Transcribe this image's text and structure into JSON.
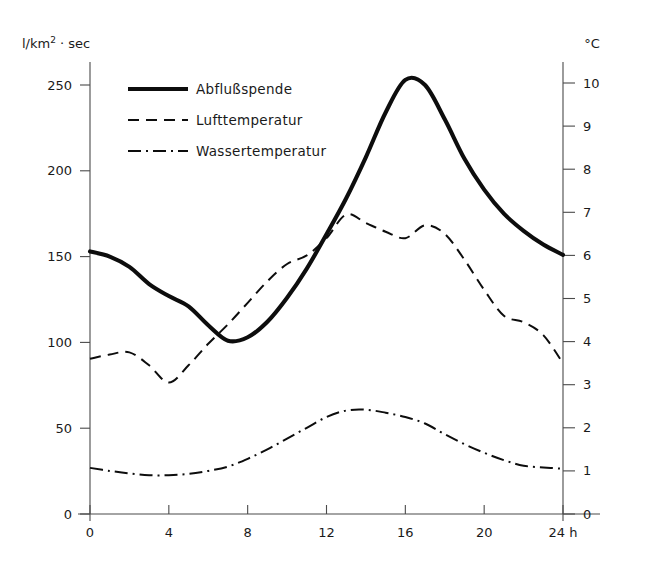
{
  "chart_data": {
    "type": "line",
    "title": "",
    "xlabel": "24 h",
    "ylabel": "l/km2 · sec",
    "ylabel_parts": {
      "prefix": "l/km",
      "sup": "2",
      "suffix": " · sec"
    },
    "y2label": "°C",
    "x": [
      0,
      1,
      2,
      3,
      4,
      5,
      6,
      7,
      8,
      9,
      10,
      11,
      12,
      13,
      14,
      15,
      16,
      17,
      18,
      19,
      20,
      21,
      22,
      23,
      24
    ],
    "xticks": [
      "0",
      "4",
      "8",
      "12",
      "16",
      "20",
      "24 h"
    ],
    "xtick_values": [
      0,
      4,
      8,
      12,
      16,
      20,
      24
    ],
    "xlim": [
      0,
      24
    ],
    "yticks": [
      "0",
      "50",
      "100",
      "150",
      "200",
      "250"
    ],
    "ytick_values": [
      0,
      50,
      100,
      150,
      200,
      250
    ],
    "ylim": [
      0,
      260
    ],
    "y2ticks": [
      "0",
      "1",
      "2",
      "3",
      "4",
      "5",
      "6",
      "7",
      "8",
      "9",
      "10"
    ],
    "y2tick_values": [
      0,
      1,
      2,
      3,
      4,
      5,
      6,
      7,
      8,
      9,
      10
    ],
    "y2lim": [
      0,
      10.05
    ],
    "grid": "off",
    "legend_position": "upper-left-inside",
    "series": [
      {
        "name": "Abflußspende",
        "axis": "left",
        "style": "solid",
        "unit": "l/km2 · sec",
        "values": [
          153,
          150,
          144,
          134,
          127,
          121,
          110,
          101,
          103,
          112,
          126,
          143,
          163,
          184,
          208,
          234,
          253,
          250,
          230,
          207,
          189,
          175,
          165,
          157,
          151
        ]
      },
      {
        "name": "Lufttemperatur",
        "axis": "right",
        "style": "dashed",
        "unit": "°C",
        "values": [
          3.6,
          3.7,
          3.75,
          3.45,
          3.05,
          3.45,
          3.95,
          4.4,
          4.9,
          5.4,
          5.8,
          6.0,
          6.4,
          6.95,
          6.75,
          6.55,
          6.4,
          6.7,
          6.5,
          5.9,
          5.2,
          4.6,
          4.45,
          4.15,
          3.5
        ]
      },
      {
        "name": "Wassertemperatur",
        "axis": "right",
        "style": "dash-dot",
        "unit": "°C",
        "values": [
          1.07,
          1.0,
          0.94,
          0.9,
          0.9,
          0.93,
          1.0,
          1.1,
          1.28,
          1.5,
          1.75,
          2.0,
          2.25,
          2.4,
          2.42,
          2.35,
          2.25,
          2.1,
          1.85,
          1.62,
          1.42,
          1.25,
          1.12,
          1.08,
          1.05
        ]
      }
    ]
  },
  "legend": {
    "items": [
      {
        "label": "Abflußspende",
        "style": "solid"
      },
      {
        "label": "Lufttemperatur",
        "style": "dashed"
      },
      {
        "label": "Wassertemperatur",
        "style": "dash-dot"
      }
    ]
  },
  "colors": {
    "ink": "#0d0d0d",
    "axis": "#4a4a4a",
    "background": "#ffffff"
  }
}
